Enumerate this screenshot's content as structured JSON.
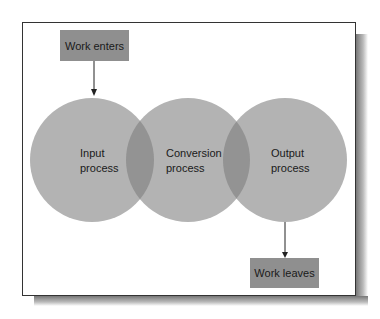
{
  "diagram": {
    "boxes": {
      "enters": "Work enters",
      "leaves": "Work leaves"
    },
    "circles": [
      {
        "line1": "Input",
        "line2": "process"
      },
      {
        "line1": "Conversion",
        "line2": "process"
      },
      {
        "line1": "Output",
        "line2": "process"
      }
    ],
    "colors": {
      "circle": "#b3b3b3",
      "overlap": "#939393",
      "box": "#8f8f8f"
    }
  }
}
